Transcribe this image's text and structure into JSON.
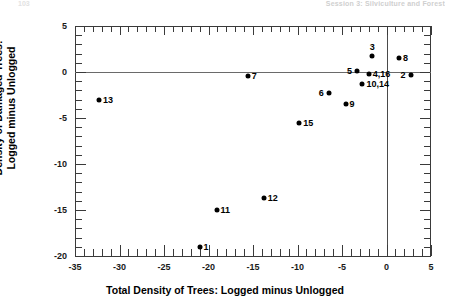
{
  "page": {
    "header_text": "Session 3: Silviculture and Forest",
    "page_number": "103"
  },
  "chart_data": {
    "type": "scatter",
    "title": "",
    "xlabel": "Total Density of Trees: Logged minus Unlogged",
    "ylabel": "Density of Damaged Trees: Logged minus Unlogged",
    "ylabel_line1": "Density of Damaged Trees:",
    "ylabel_line2": "Logged minus Unlogged",
    "xlim": [
      -35,
      5
    ],
    "ylim": [
      -20,
      5
    ],
    "xticks": [
      -35,
      -30,
      -25,
      -20,
      -15,
      -10,
      -5,
      0,
      5
    ],
    "xticklabels": [
      "-35",
      "-30",
      "-25",
      "-20",
      "-15",
      "-10",
      "-5",
      "0",
      "5"
    ],
    "yticks": [
      5,
      0,
      -5,
      -10,
      -15,
      -20
    ],
    "yticklabels": [
      "5",
      "0",
      "-5",
      "-10",
      "-15",
      "-20"
    ],
    "xtick_minor_step": 1,
    "ytick_minor_step": 1,
    "grid": false,
    "legend": null,
    "reference_lines": [
      {
        "axis": "x",
        "value": 0
      },
      {
        "axis": "y",
        "value": 0
      }
    ],
    "points": [
      {
        "label": "13",
        "x": -32.3,
        "y": -3.0,
        "label_pos": "right"
      },
      {
        "label": "1",
        "x": -21.0,
        "y": -19.0,
        "label_pos": "right"
      },
      {
        "label": "11",
        "x": -19.1,
        "y": -15.0,
        "label_pos": "right"
      },
      {
        "label": "15",
        "x": -9.8,
        "y": -5.5,
        "label_pos": "right"
      },
      {
        "label": "12",
        "x": -13.8,
        "y": -13.7,
        "label_pos": "right"
      },
      {
        "label": "7",
        "x": -15.6,
        "y": -0.4,
        "label_pos": "right"
      },
      {
        "label": "6",
        "x": -6.5,
        "y": -2.3,
        "label_pos": "left"
      },
      {
        "label": "9",
        "x": -4.6,
        "y": -3.5,
        "label_pos": "right"
      },
      {
        "label": "5",
        "x": -3.3,
        "y": 0.1,
        "label_pos": "left"
      },
      {
        "label": "3",
        "x": -1.6,
        "y": 1.7,
        "label_pos": "above"
      },
      {
        "label": "8",
        "x": 1.4,
        "y": 1.5,
        "label_pos": "right"
      },
      {
        "label": "4,16",
        "x": -2.0,
        "y": -0.2,
        "label_pos": "right"
      },
      {
        "label": "10,14",
        "x": -2.7,
        "y": -1.3,
        "label_pos": "right"
      },
      {
        "label": "2",
        "x": 2.7,
        "y": -0.3,
        "label_pos": "left"
      }
    ]
  }
}
